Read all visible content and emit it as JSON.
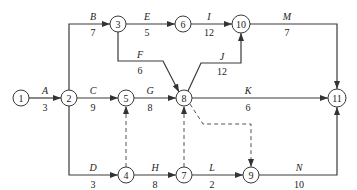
{
  "diagram": {
    "type": "activity-on-arrow network",
    "nodes": [
      {
        "id": "1",
        "x": 21,
        "y": 98
      },
      {
        "id": "2",
        "x": 69,
        "y": 98
      },
      {
        "id": "3",
        "x": 118,
        "y": 24
      },
      {
        "id": "4",
        "x": 126,
        "y": 175
      },
      {
        "id": "5",
        "x": 126,
        "y": 98
      },
      {
        "id": "6",
        "x": 183,
        "y": 24
      },
      {
        "id": "7",
        "x": 184,
        "y": 175
      },
      {
        "id": "8",
        "x": 184,
        "y": 98
      },
      {
        "id": "9",
        "x": 251,
        "y": 175
      },
      {
        "id": "10",
        "x": 241,
        "y": 24
      },
      {
        "id": "11",
        "x": 337,
        "y": 98
      }
    ],
    "activities": [
      {
        "name": "A",
        "duration": "3",
        "from": "1",
        "to": "2"
      },
      {
        "name": "B",
        "duration": "7",
        "from": "2",
        "to": "3"
      },
      {
        "name": "C",
        "duration": "9",
        "from": "2",
        "to": "5"
      },
      {
        "name": "D",
        "duration": "3",
        "from": "2",
        "to": "4"
      },
      {
        "name": "E",
        "duration": "5",
        "from": "3",
        "to": "6"
      },
      {
        "name": "F",
        "duration": "6",
        "from": "3",
        "to": "8"
      },
      {
        "name": "G",
        "duration": "8",
        "from": "5",
        "to": "8"
      },
      {
        "name": "H",
        "duration": "8",
        "from": "4",
        "to": "7"
      },
      {
        "name": "I",
        "duration": "12",
        "from": "6",
        "to": "10"
      },
      {
        "name": "J",
        "duration": "12",
        "from": "8",
        "to": "10"
      },
      {
        "name": "K",
        "duration": "6",
        "from": "8",
        "to": "11"
      },
      {
        "name": "L",
        "duration": "2",
        "from": "7",
        "to": "9"
      },
      {
        "name": "M",
        "duration": "7",
        "from": "10",
        "to": "11"
      },
      {
        "name": "N",
        "duration": "10",
        "from": "9",
        "to": "11"
      }
    ],
    "dummies": [
      {
        "from": "4",
        "to": "5"
      },
      {
        "from": "7",
        "to": "8"
      },
      {
        "from": "8",
        "to": "9"
      }
    ]
  }
}
